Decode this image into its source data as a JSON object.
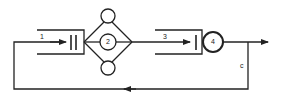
{
  "diagram": {
    "type": "queueing-network",
    "colors": {
      "stroke": "#222222",
      "background": "#ffffff"
    },
    "nodes": [
      {
        "id": "queue-1",
        "kind": "queue",
        "label": "1",
        "servers_bars": 2
      },
      {
        "id": "server-2",
        "kind": "parallel-servers",
        "label": "2",
        "server_count": 3
      },
      {
        "id": "queue-3",
        "kind": "queue",
        "label": "3",
        "servers_bars": 1
      },
      {
        "id": "server-4",
        "kind": "single-server",
        "label": "4"
      }
    ],
    "feedback": {
      "label": "c"
    },
    "labels": {
      "queue1": "1",
      "server2": "2",
      "queue3": "3",
      "server4": "4",
      "feedback": "c"
    }
  }
}
